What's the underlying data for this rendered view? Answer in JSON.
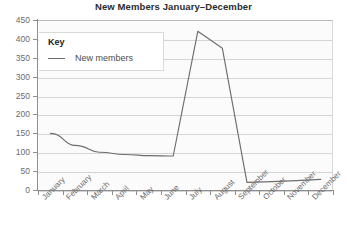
{
  "chart_data": {
    "type": "line",
    "title": "New Members January–December",
    "xlabel": "",
    "ylabel": "",
    "categories": [
      "January",
      "February",
      "March",
      "April",
      "May",
      "June",
      "July",
      "August",
      "September",
      "October",
      "November",
      "December"
    ],
    "series": [
      {
        "name": "New members",
        "values": [
          150,
          118,
          100,
          94,
          91,
          90,
          420,
          375,
          20,
          22,
          25,
          28
        ]
      }
    ],
    "ylim": [
      0,
      450
    ],
    "yticks": [
      0,
      50,
      100,
      150,
      200,
      250,
      300,
      350,
      400,
      450
    ],
    "ytick_labels": [
      "0",
      "50",
      "100",
      "150",
      "200",
      "250",
      "300",
      "350",
      "400",
      "450"
    ],
    "grid": true,
    "legend_position": "top-left",
    "line_color": "#6d6d6d",
    "grid_color": "#d5d5d5",
    "plot_background": "#fbfbfb",
    "axis_color": "#8e8e8e"
  },
  "legend": {
    "title": "Key",
    "entries": [
      {
        "label": "New members",
        "marker": "line-swatch-icon"
      }
    ]
  },
  "caption": {
    "text": ""
  }
}
